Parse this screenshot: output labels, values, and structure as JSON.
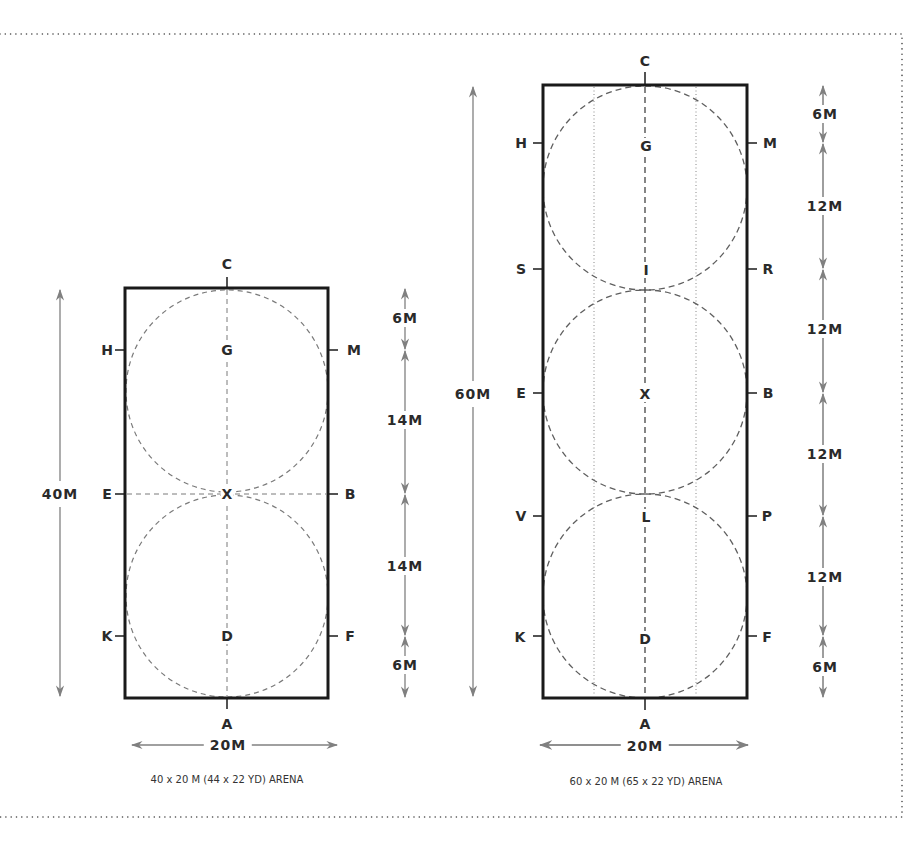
{
  "colors": {
    "border": "#1a1a1a",
    "dashed": "#777777",
    "arrow": "#808080",
    "text": "#2a2a2a",
    "frame_dots": "#444444"
  },
  "arena_small": {
    "caption": "40 x 20 M (44 x 22 YD) ARENA",
    "letters": {
      "C": "C",
      "H": "H",
      "M": "M",
      "E": "E",
      "B": "B",
      "K": "K",
      "F": "F",
      "A": "A",
      "G": "G",
      "X": "X",
      "D": "D"
    },
    "length_label": "40M",
    "width_label": "20M",
    "segments": [
      "6M",
      "14M",
      "14M",
      "6M"
    ]
  },
  "arena_large": {
    "caption": "60 x 20 M (65 x 22 YD) ARENA",
    "letters": {
      "C": "C",
      "H": "H",
      "M": "M",
      "S": "S",
      "R": "R",
      "E": "E",
      "B": "B",
      "V": "V",
      "P": "P",
      "K": "K",
      "F": "F",
      "A": "A",
      "G": "G",
      "I": "I",
      "X": "X",
      "L": "L",
      "D": "D"
    },
    "length_label": "60M",
    "width_label": "20M",
    "segments": [
      "6M",
      "12M",
      "12M",
      "12M",
      "12M",
      "6M"
    ]
  }
}
